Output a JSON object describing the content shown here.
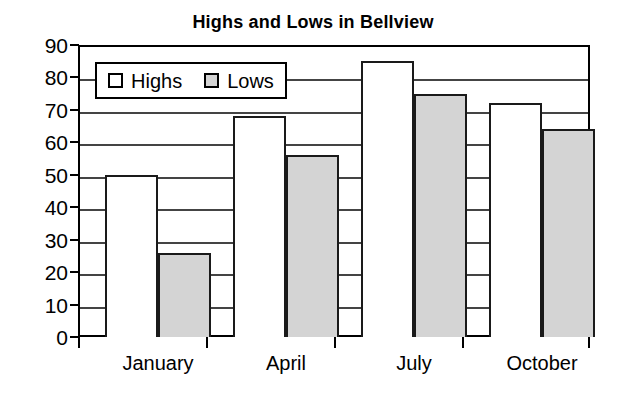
{
  "chart_data": {
    "type": "bar",
    "title": "Highs and Lows in Bellview",
    "xlabel": "",
    "ylabel": "",
    "categories": [
      "January",
      "April",
      "July",
      "October"
    ],
    "series": [
      {
        "name": "Highs",
        "color": "#ffffff",
        "values": [
          50,
          68,
          85,
          72
        ]
      },
      {
        "name": "Lows",
        "color": "#d4d4d4",
        "values": [
          26,
          56,
          75,
          64
        ]
      }
    ],
    "ylim": [
      0,
      90
    ],
    "ytick_step": 10,
    "yticks": [
      0,
      10,
      20,
      30,
      40,
      50,
      60,
      70,
      80,
      90
    ],
    "ytick_labels": [
      "0",
      "10",
      "20",
      "30",
      "40",
      "50",
      "60",
      "70",
      "80",
      "90"
    ],
    "grid": true,
    "grid_axis": "y",
    "legend_position": "top-left-inside",
    "legend_entries": [
      "Highs",
      "Lows"
    ],
    "bar_border_color": "#1a1a1a",
    "frame_color": "#000000"
  }
}
